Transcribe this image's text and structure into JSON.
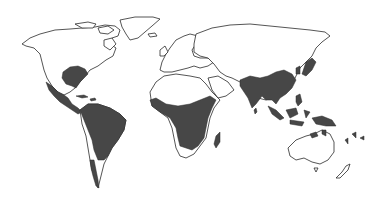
{
  "map": {
    "type": "world outline map",
    "projection": "equirectangular-like",
    "background_color": "#ffffff",
    "land_fill": "#ffffff",
    "outline_color": "#2a2a2a",
    "highlight_color": "#474747",
    "title": "",
    "legend": [],
    "shaded_regions": [
      {
        "name": "Southeastern United States"
      },
      {
        "name": "Mexico and Central America"
      },
      {
        "name": "Caribbean islands"
      },
      {
        "name": "Northern and central South America"
      },
      {
        "name": "Western coastal South America (Chile strip)"
      },
      {
        "name": "Sub-Saharan Africa (tropical belt)"
      },
      {
        "name": "Madagascar"
      },
      {
        "name": "India and South Asia"
      },
      {
        "name": "Southern China and Southeast Asia"
      },
      {
        "name": "Japan and southern Korea"
      },
      {
        "name": "Indonesia, Philippines and Papua New Guinea"
      },
      {
        "name": "Northern Australia coast"
      },
      {
        "name": "Pacific islands"
      }
    ]
  }
}
